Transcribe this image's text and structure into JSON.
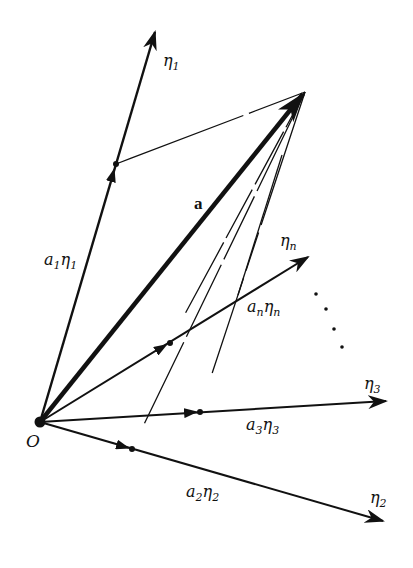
{
  "diagram": {
    "colors": {
      "ink": "#111111",
      "background": "#ffffff"
    },
    "origin": {
      "label": "O",
      "x": 40,
      "y": 422
    },
    "main_vector": {
      "label": "a",
      "tip": [
        305,
        92
      ]
    },
    "basis": [
      {
        "id": "eta1",
        "label": "η",
        "sub": "1",
        "tip": [
          155,
          30
        ],
        "point": [
          116,
          164
        ],
        "component_label": "a",
        "component_sub": "1"
      },
      {
        "id": "etan",
        "label": "η",
        "sub": "n",
        "tip": [
          310,
          256
        ],
        "point": [
          170,
          343
        ],
        "component_label": "a",
        "component_sub": "n"
      },
      {
        "id": "eta3",
        "label": "η",
        "sub": "3",
        "tip": [
          388,
          401
        ],
        "point": [
          200,
          412
        ],
        "component_label": "a",
        "component_sub": "3"
      },
      {
        "id": "eta2",
        "label": "η",
        "sub": "2",
        "tip": [
          385,
          522
        ],
        "point": [
          132,
          449
        ],
        "component_label": "a",
        "component_sub": "2"
      }
    ],
    "ellipsis": "⋱",
    "labels": {
      "eta1": "η1",
      "eta2": "η2",
      "eta3": "η3",
      "etan": "ηn",
      "a1eta1": "a1η1",
      "a2eta2": "a2η2",
      "a3eta3": "a3η3",
      "aneta_n": "anηn",
      "a": "a",
      "O": "O"
    }
  }
}
